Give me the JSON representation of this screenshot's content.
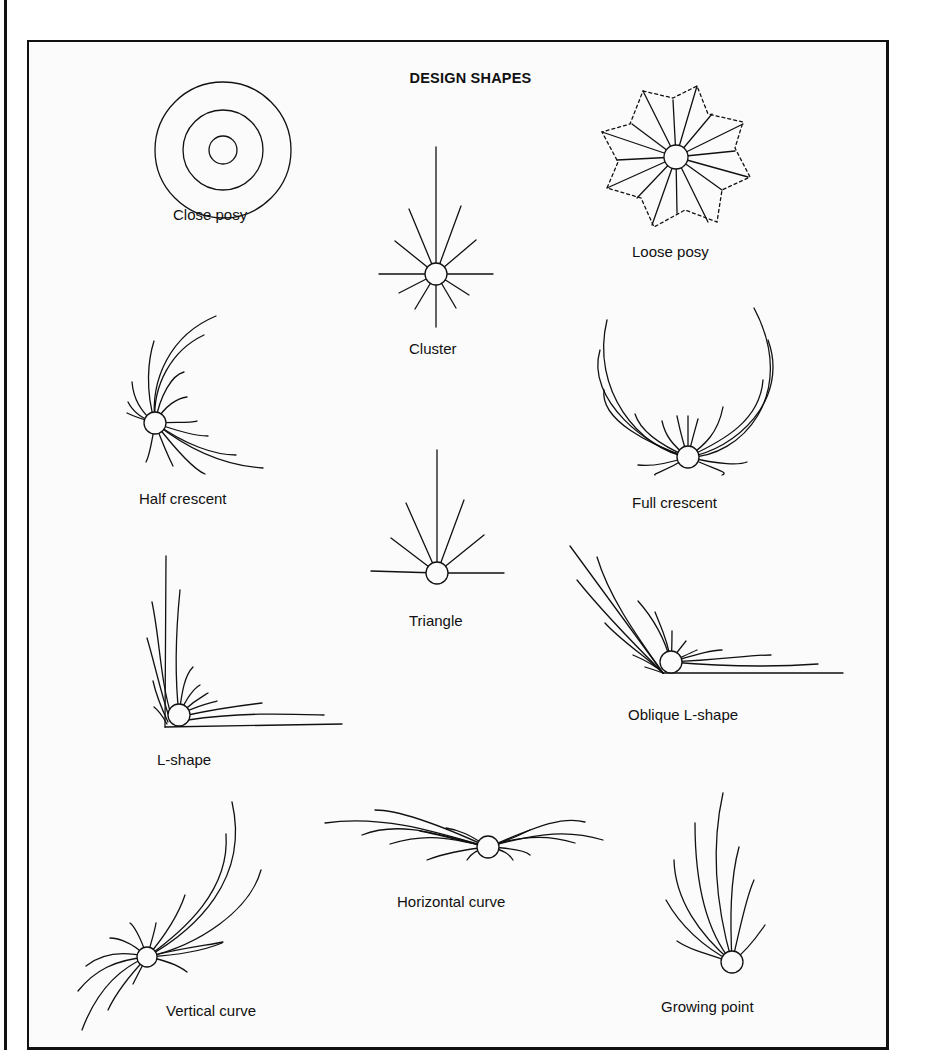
{
  "title": "DESIGN SHAPES",
  "shapes": [
    {
      "id": "close-posy",
      "label": "Close posy"
    },
    {
      "id": "cluster",
      "label": "Cluster"
    },
    {
      "id": "loose-posy",
      "label": "Loose posy"
    },
    {
      "id": "half-crescent",
      "label": "Half crescent"
    },
    {
      "id": "full-crescent",
      "label": "Full crescent"
    },
    {
      "id": "triangle",
      "label": "Triangle"
    },
    {
      "id": "l-shape",
      "label": "L-shape"
    },
    {
      "id": "oblique-l-shape",
      "label": "Oblique L-shape"
    },
    {
      "id": "vertical-curve",
      "label": "Vertical curve"
    },
    {
      "id": "horizontal-curve",
      "label": "Horizontal curve"
    },
    {
      "id": "growing-point",
      "label": "Growing point"
    }
  ],
  "colors": {
    "ink": "#111111",
    "paper": "#fbfbfb"
  }
}
